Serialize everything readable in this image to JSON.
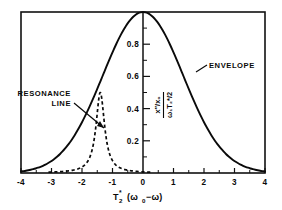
{
  "figure": {
    "background_color": "#ffffff",
    "ink_color": "#0a0a0a"
  },
  "axes": {
    "x_label_parts": {
      "base": "T",
      "subscript": "2",
      "superscript": "*",
      "argument": "(ω",
      "argument_sub": "0",
      "argument_tail": "−ω)"
    },
    "x_label_plain": "T2* (ω0−ω)",
    "y_label_numerator": "x″/x₀",
    "y_label_denominator": "ω₁T₂*/2",
    "y_label_plain": "(x″/x₀) / (ω₁T₂*/2)",
    "x_ticks": [
      "-4",
      "-3",
      "-2",
      "-1",
      "0",
      "1",
      "2",
      "3",
      "4"
    ],
    "x_tick_values": [
      -4,
      -3,
      -2,
      -1,
      0,
      1,
      2,
      3,
      4
    ],
    "y_ticks": [
      "0.2",
      "0.4",
      "0.6",
      "0.8"
    ],
    "y_tick_values": [
      0.2,
      0.4,
      0.6,
      0.8
    ],
    "y_minor_values": [
      0.1,
      0.3,
      0.5,
      0.7,
      0.9
    ],
    "xlim": [
      -4,
      4
    ],
    "ylim": [
      0,
      1
    ]
  },
  "annotations": {
    "envelope_label": "ENVELOPE",
    "resonance_label_line1": "RESONANCE",
    "resonance_label_line2": "LINE"
  },
  "chart_data": {
    "type": "line",
    "title": "",
    "xlabel": "T2* (ω0−ω)",
    "ylabel": "(x″/x₀) / (ω₁T₂*/2)",
    "xlim": [
      -4,
      4
    ],
    "ylim": [
      0,
      1
    ],
    "grid": false,
    "legend": "none (inline annotations)",
    "series": [
      {
        "name": "ENVELOPE",
        "style": "solid",
        "form": "gaussian",
        "peak_x": 0,
        "peak_y": 1.0,
        "half_width": 1.55,
        "x": [
          -4.0,
          -3.75,
          -3.5,
          -3.25,
          -3.0,
          -2.75,
          -2.5,
          -2.25,
          -2.0,
          -1.75,
          -1.5,
          -1.25,
          -1.0,
          -0.75,
          -0.5,
          -0.25,
          0.0,
          0.25,
          0.5,
          0.75,
          1.0,
          1.25,
          1.5,
          1.75,
          2.0,
          2.25,
          2.5,
          2.75,
          3.0,
          3.25,
          3.5,
          3.75,
          4.0
        ],
        "y": [
          0.003,
          0.007,
          0.014,
          0.026,
          0.046,
          0.077,
          0.122,
          0.184,
          0.263,
          0.358,
          0.464,
          0.575,
          0.683,
          0.78,
          0.859,
          0.915,
          0.947,
          0.915,
          0.859,
          0.78,
          0.683,
          0.575,
          0.464,
          0.358,
          0.263,
          0.184,
          0.122,
          0.077,
          0.046,
          0.026,
          0.014,
          0.007,
          0.003
        ]
      },
      {
        "name": "RESONANCE LINE",
        "style": "dashed",
        "form": "lorentzian",
        "peak_x": -1.4,
        "peak_y": 0.5,
        "half_width": 0.17,
        "x": [
          -2.6,
          -2.4,
          -2.2,
          -2.0,
          -1.9,
          -1.8,
          -1.7,
          -1.6,
          -1.55,
          -1.5,
          -1.45,
          -1.4,
          -1.35,
          -1.3,
          -1.25,
          -1.2,
          -1.1,
          -1.0,
          -0.9,
          -0.8,
          -0.6,
          -0.4
        ],
        "y": [
          0.012,
          0.017,
          0.026,
          0.046,
          0.064,
          0.094,
          0.148,
          0.253,
          0.33,
          0.41,
          0.475,
          0.5,
          0.475,
          0.41,
          0.33,
          0.253,
          0.122,
          0.064,
          0.039,
          0.026,
          0.013,
          0.007
        ]
      }
    ]
  }
}
